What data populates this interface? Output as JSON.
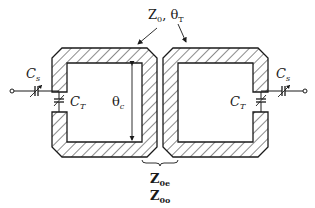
{
  "diagram": {
    "type": "circuit-schematic",
    "colors": {
      "line": "#1a1a1a",
      "background": "#ffffff"
    },
    "labels": {
      "top_impedance": {
        "main": "Z",
        "sub": "0",
        "sep": ", ",
        "angle": "θ",
        "angle_sub": "T"
      },
      "left_series_cap": {
        "main": "C",
        "sub": "s"
      },
      "left_tuning_cap": {
        "main": "C",
        "sub": "T"
      },
      "right_series_cap": {
        "main": "C",
        "sub": "s"
      },
      "right_tuning_cap": {
        "main": "C",
        "sub": "T"
      },
      "coupled_length": {
        "main": "θ",
        "sub": "c"
      },
      "even_mode": {
        "main": "Z",
        "sub": "0e"
      },
      "odd_mode": {
        "main": "Z",
        "sub": "0o"
      }
    },
    "elements": [
      "left-resonator",
      "right-resonator",
      "left-input-terminal",
      "right-output-terminal",
      "coupled-section-brace",
      "theta-c-dimension-arrow",
      "impedance-pointer-arrows"
    ]
  }
}
